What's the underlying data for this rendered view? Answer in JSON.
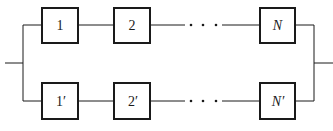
{
  "diagram": {
    "type": "parallel-series reliability block diagram",
    "top_branch": {
      "blocks": [
        {
          "label": "1",
          "italic": false
        },
        {
          "label": "2",
          "italic": false
        },
        {
          "label": "N",
          "italic": true
        }
      ],
      "ellipsis": "· · ·"
    },
    "bottom_branch": {
      "blocks": [
        {
          "label": "1′",
          "italic": false
        },
        {
          "label": "2′",
          "italic": false
        },
        {
          "label": "N′",
          "italic": true
        }
      ],
      "ellipsis": "· · ·"
    },
    "colors": {
      "line": "#1a1a1a",
      "background": "#ffffff"
    }
  }
}
